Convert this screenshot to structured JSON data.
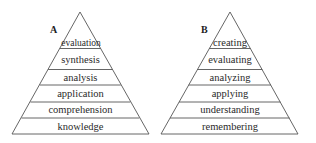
{
  "pyramids": [
    {
      "letter": "A",
      "levels_top_to_bottom": [
        "evaluation",
        "synthesis",
        "analysis",
        "application",
        "comprehension",
        "knowledge"
      ]
    },
    {
      "letter": "B",
      "levels_top_to_bottom": [
        "creating",
        "evaluating",
        "analyzing",
        "applying",
        "understanding",
        "remembering"
      ]
    }
  ]
}
